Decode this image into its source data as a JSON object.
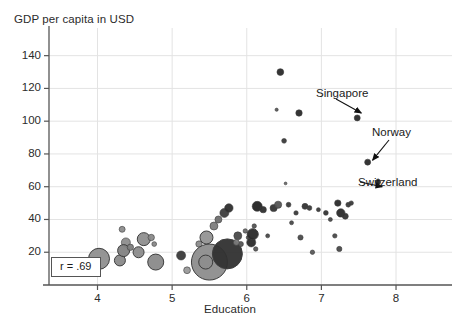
{
  "chart_data": {
    "type": "scatter",
    "title": "",
    "xlabel": "Education",
    "ylabel": "GDP per capita in USD",
    "xlim": [
      3.35,
      8.75
    ],
    "ylim": [
      0,
      152
    ],
    "xticks": [
      4,
      5,
      6,
      7,
      8
    ],
    "yticks": [
      20,
      40,
      60,
      80,
      100,
      120,
      140
    ],
    "grid": true,
    "legend": "none",
    "bubble_chart": true,
    "size_encodes": "population",
    "annotations": [
      {
        "label": "Singapore",
        "x": 7.48,
        "y": 102,
        "point_x": 7.48,
        "point_y": 102
      },
      {
        "label": "Norway",
        "x": 7.62,
        "y": 75,
        "point_x": 7.62,
        "point_y": 75
      },
      {
        "label": "Switzerland",
        "x": 7.76,
        "y": 63,
        "point_x": 7.76,
        "point_y": 63
      }
    ],
    "correlation_label": "r = .69",
    "correlation_value": 0.69,
    "points": [
      {
        "x": 4.02,
        "y": 16,
        "r": 10.5,
        "shade": "#8f8f8f"
      },
      {
        "x": 4.33,
        "y": 34,
        "r": 3.0,
        "shade": "#8c8c8c"
      },
      {
        "x": 4.3,
        "y": 15,
        "r": 5.5,
        "shade": "#8a8a8a"
      },
      {
        "x": 4.38,
        "y": 26,
        "r": 4.5,
        "shade": "#8d8d8d"
      },
      {
        "x": 4.35,
        "y": 21,
        "r": 6.0,
        "shade": "#828282"
      },
      {
        "x": 4.44,
        "y": 23,
        "r": 3.2,
        "shade": "#7d7d7d"
      },
      {
        "x": 4.55,
        "y": 20,
        "r": 5.5,
        "shade": "#8b8b8b"
      },
      {
        "x": 4.62,
        "y": 28,
        "r": 6.5,
        "shade": "#8f8f8f"
      },
      {
        "x": 4.72,
        "y": 29,
        "r": 3.2,
        "shade": "#8a8a8a"
      },
      {
        "x": 4.76,
        "y": 25,
        "r": 2.4,
        "shade": "#888888"
      },
      {
        "x": 4.78,
        "y": 14,
        "r": 8.0,
        "shade": "#8a8a8a"
      },
      {
        "x": 5.12,
        "y": 18,
        "r": 4.5,
        "shade": "#3a3a3a"
      },
      {
        "x": 5.2,
        "y": 9,
        "r": 3.4,
        "shade": "#9a9a9a"
      },
      {
        "x": 5.36,
        "y": 25,
        "r": 3.2,
        "shade": "#8b8b8b"
      },
      {
        "x": 5.46,
        "y": 29,
        "r": 6.5,
        "shade": "#949494"
      },
      {
        "x": 5.56,
        "y": 36,
        "r": 4.0,
        "shade": "#7d7d7d"
      },
      {
        "x": 5.62,
        "y": 40,
        "r": 3.5,
        "shade": "#6e6e6e"
      },
      {
        "x": 5.7,
        "y": 44,
        "r": 4.5,
        "shade": "#3c3c3c"
      },
      {
        "x": 5.76,
        "y": 47,
        "r": 4.2,
        "shade": "#2e2e2e"
      },
      {
        "x": 5.5,
        "y": 14,
        "r": 18.0,
        "shade": "#8d8d8d"
      },
      {
        "x": 5.45,
        "y": 14,
        "r": 7.0,
        "shade": "#8d8d8d"
      },
      {
        "x": 5.74,
        "y": 19,
        "r": 15.0,
        "shade": "#303030"
      },
      {
        "x": 5.88,
        "y": 30,
        "r": 4.0,
        "shade": "#4a4a4a"
      },
      {
        "x": 5.92,
        "y": 25,
        "r": 2.6,
        "shade": "#555555"
      },
      {
        "x": 5.86,
        "y": 26,
        "r": 3.0,
        "shade": "#7a7a7a"
      },
      {
        "x": 5.98,
        "y": 33,
        "r": 2.2,
        "shade": "#6a6a6a"
      },
      {
        "x": 6.02,
        "y": 29,
        "r": 2.0,
        "shade": "#4a4a4a"
      },
      {
        "x": 6.06,
        "y": 26,
        "r": 4.5,
        "shade": "#2a2a2a"
      },
      {
        "x": 6.08,
        "y": 31,
        "r": 5.5,
        "shade": "#2a2a2a"
      },
      {
        "x": 6.1,
        "y": 36,
        "r": 2.2,
        "shade": "#555555"
      },
      {
        "x": 6.12,
        "y": 22,
        "r": 2.2,
        "shade": "#5a5a5a"
      },
      {
        "x": 6.14,
        "y": 48,
        "r": 5.0,
        "shade": "#242424"
      },
      {
        "x": 6.22,
        "y": 46,
        "r": 3.2,
        "shade": "#2e2e2e"
      },
      {
        "x": 6.28,
        "y": 30,
        "r": 2.0,
        "shade": "#4a4a4a"
      },
      {
        "x": 6.36,
        "y": 47,
        "r": 3.6,
        "shade": "#333333"
      },
      {
        "x": 6.42,
        "y": 49,
        "r": 3.6,
        "shade": "#555555"
      },
      {
        "x": 6.45,
        "y": 130,
        "r": 3.4,
        "shade": "#2a2a2a"
      },
      {
        "x": 6.4,
        "y": 107,
        "r": 1.6,
        "shade": "#5a5a5a"
      },
      {
        "x": 6.5,
        "y": 88,
        "r": 2.4,
        "shade": "#3a3a3a"
      },
      {
        "x": 6.52,
        "y": 62,
        "r": 1.4,
        "shade": "#6a6a6a"
      },
      {
        "x": 6.56,
        "y": 49,
        "r": 2.4,
        "shade": "#3a3a3a"
      },
      {
        "x": 6.6,
        "y": 38,
        "r": 2.0,
        "shade": "#4a4a4a"
      },
      {
        "x": 6.66,
        "y": 44,
        "r": 2.2,
        "shade": "#3a3a3a"
      },
      {
        "x": 6.7,
        "y": 105,
        "r": 3.2,
        "shade": "#2a2a2a"
      },
      {
        "x": 6.72,
        "y": 29,
        "r": 2.6,
        "shade": "#4a4a4a"
      },
      {
        "x": 6.78,
        "y": 48,
        "r": 3.0,
        "shade": "#333333"
      },
      {
        "x": 6.84,
        "y": 47,
        "r": 2.4,
        "shade": "#3a3a3a"
      },
      {
        "x": 6.88,
        "y": 20,
        "r": 2.2,
        "shade": "#5a5a5a"
      },
      {
        "x": 6.96,
        "y": 46,
        "r": 2.0,
        "shade": "#3a3a3a"
      },
      {
        "x": 7.06,
        "y": 44,
        "r": 2.4,
        "shade": "#333333"
      },
      {
        "x": 7.12,
        "y": 40,
        "r": 2.0,
        "shade": "#4a4a4a"
      },
      {
        "x": 7.18,
        "y": 30,
        "r": 2.2,
        "shade": "#4a4a4a"
      },
      {
        "x": 7.22,
        "y": 50,
        "r": 3.2,
        "shade": "#2a2a2a"
      },
      {
        "x": 7.26,
        "y": 44,
        "r": 4.2,
        "shade": "#2a2a2a"
      },
      {
        "x": 7.32,
        "y": 42,
        "r": 3.0,
        "shade": "#333333"
      },
      {
        "x": 7.36,
        "y": 49,
        "r": 2.4,
        "shade": "#3a3a3a"
      },
      {
        "x": 7.4,
        "y": 50,
        "r": 2.2,
        "shade": "#3a3a3a"
      },
      {
        "x": 7.24,
        "y": 22,
        "r": 2.6,
        "shade": "#4a4a4a"
      },
      {
        "x": 7.48,
        "y": 102,
        "r": 3.0,
        "shade": "#2a2a2a"
      },
      {
        "x": 7.62,
        "y": 75,
        "r": 3.0,
        "shade": "#2a2a2a"
      },
      {
        "x": 7.76,
        "y": 63,
        "r": 2.6,
        "shade": "#2a2a2a"
      }
    ]
  },
  "axes": {
    "y_title": "GDP per capita in USD",
    "x_title": "Education",
    "y_tick_labels": [
      "140",
      "120",
      "100",
      "80",
      "60",
      "40",
      "20"
    ],
    "x_tick_labels": [
      "4",
      "5",
      "6",
      "7",
      "8"
    ]
  },
  "annotations": {
    "singapore": "Singapore",
    "norway": "Norway",
    "switzerland": "Switzerland",
    "correlation": "r = .69"
  },
  "colors": {
    "axis": "#555555",
    "grid": "#e3e3e3",
    "text": "#1a1a1a",
    "background": "#ffffff"
  }
}
